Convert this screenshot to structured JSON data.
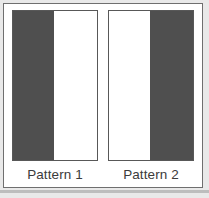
{
  "figure": {
    "background_color": "#e9e9e9",
    "panel_color": "#ffffff",
    "panel_border_color": "#6f6f6f",
    "dark_color": "#4f4f4f",
    "light_color": "#ffffff",
    "label_color": "#3b3b3b",
    "swatch_border_color": "#585858"
  },
  "patterns": [
    {
      "label": "Pattern 1",
      "stripes": [
        {
          "fill": "dark",
          "width_fraction": 0.49
        },
        {
          "fill": "light",
          "width_fraction": 0.51
        }
      ]
    },
    {
      "label": "Pattern 2",
      "stripes": [
        {
          "fill": "light",
          "width_fraction": 0.49
        },
        {
          "fill": "dark",
          "width_fraction": 0.51
        }
      ]
    }
  ]
}
